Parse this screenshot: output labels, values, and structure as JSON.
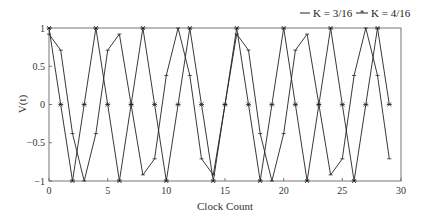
{
  "chart_data": {
    "type": "line",
    "title": "",
    "xlabel": "Clock Count",
    "ylabel": "V(t)",
    "xlim": [
      0,
      30
    ],
    "ylim": [
      -1,
      1
    ],
    "grid": false,
    "legend_position": "top-right, above plot",
    "x_ticks": [
      0,
      5,
      10,
      15,
      20,
      25,
      30
    ],
    "x_tick_labels": [
      "0",
      "5",
      "10",
      "15",
      "20",
      "25",
      "30"
    ],
    "y_ticks": [
      1,
      0.5,
      0,
      -0.5,
      -1
    ],
    "y_tick_labels": [
      "1",
      "0.5",
      "0",
      "−0.5",
      "−1"
    ],
    "x": [
      0,
      1,
      2,
      3,
      4,
      5,
      6,
      7,
      8,
      9,
      10,
      11,
      12,
      13,
      14,
      15,
      16,
      17,
      18,
      19,
      20,
      21,
      22,
      23,
      24,
      25,
      26,
      27,
      28,
      29
    ],
    "series": [
      {
        "name": "K = 3/16",
        "marker": "plus",
        "values": [
          0.92,
          0.71,
          -0.38,
          -1,
          -0.38,
          0.71,
          0.92,
          0,
          -0.92,
          -0.71,
          0.38,
          1,
          0.38,
          -0.71,
          -0.92,
          0,
          0.92,
          0.71,
          -0.38,
          -1,
          -0.38,
          0.71,
          0.92,
          0,
          -0.92,
          -0.71,
          0.38,
          1,
          0.38,
          -0.71
        ]
      },
      {
        "name": "K = 4/16",
        "marker": "star",
        "values": [
          1,
          0,
          -1,
          0,
          1,
          0,
          -1,
          0,
          1,
          0,
          -1,
          0,
          1,
          0,
          -1,
          0,
          1,
          0,
          -1,
          0,
          1,
          0,
          -1,
          0,
          1,
          0,
          -1,
          0,
          1,
          0
        ]
      }
    ]
  },
  "legend": {
    "items": [
      {
        "label": "K = 3/16",
        "marker": "plus"
      },
      {
        "label": "K = 4/16",
        "marker": "star"
      }
    ]
  },
  "colors": {
    "line": "#222222",
    "axis": "#555555",
    "background": "#ffffff"
  }
}
